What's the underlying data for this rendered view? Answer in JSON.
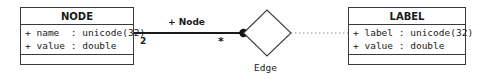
{
  "diagram": {
    "kind": "uml-class-diagram",
    "colors": {
      "stroke": "#3a3a3a",
      "line": "#1a1a1a",
      "text": "#1a1a1a",
      "background": "#ffffff",
      "dotted": "#8a8a8a"
    },
    "classes": [
      {
        "id": "node",
        "name": "NODE",
        "attributes": [
          "+ name  : unicode(32)",
          "+ value : double"
        ],
        "operations": []
      },
      {
        "id": "label",
        "name": "LABEL",
        "attributes": [
          "+ label : unicode(32)",
          "+ value : double"
        ],
        "operations": []
      }
    ],
    "association": {
      "role_label": "+ Node",
      "source_multiplicity": "2",
      "target_multiplicity": "*",
      "association_class_name": "Edge",
      "source_class": "NODE",
      "target_class": "LABEL",
      "end_marker": "filled-dot",
      "link_style": "dotted"
    }
  }
}
